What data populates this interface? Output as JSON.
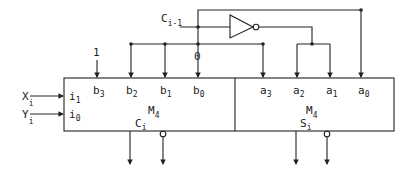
{
  "diagram": {
    "type": "logic-circuit",
    "blocks": [
      {
        "id": "left-M4",
        "name": "M",
        "name_sub": "4",
        "output": "C",
        "output_sub": "i"
      },
      {
        "id": "right-M4",
        "name": "M",
        "name_sub": "4",
        "output": "S",
        "output_sub": "i"
      }
    ],
    "left_inputs": {
      "X": {
        "label": "X",
        "sub": "i",
        "pin": "i",
        "pin_sub": "1"
      },
      "Y": {
        "label": "Y",
        "sub": "i",
        "pin": "i",
        "pin_sub": "0"
      }
    },
    "b_pins": [
      {
        "label": "b",
        "sub": "3"
      },
      {
        "label": "b",
        "sub": "2"
      },
      {
        "label": "b",
        "sub": "1"
      },
      {
        "label": "b",
        "sub": "0"
      }
    ],
    "a_pins": [
      {
        "label": "a",
        "sub": "3"
      },
      {
        "label": "a",
        "sub": "2"
      },
      {
        "label": "a",
        "sub": "1"
      },
      {
        "label": "a",
        "sub": "0"
      }
    ],
    "carry_in": {
      "label": "C",
      "sub": "i-1"
    },
    "const_one": "1",
    "const_zero": "0",
    "gate": "inverter"
  }
}
